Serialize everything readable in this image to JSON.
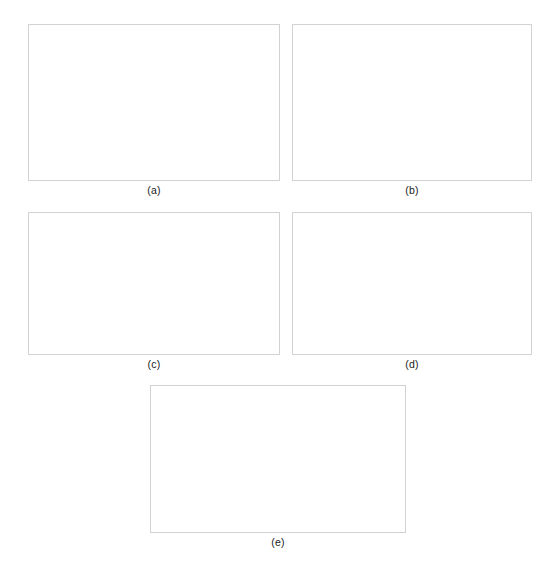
{
  "figure": {
    "background": "#ffffff",
    "panel_border_color": "#d2d2d2",
    "line_color": "#111111",
    "grid_color": "#d9d9d9",
    "captions": {
      "a": "(a)",
      "b": "(b)",
      "c": "(c)",
      "d": "(d)",
      "e": "(e)"
    }
  },
  "chart_data": [
    {
      "id": "a",
      "type": "line",
      "title": "",
      "xlabel": "Arc length, μm",
      "ylabel": "σhyd, MPa",
      "ylabel_main": "σ",
      "ylabel_sub": "hyd",
      "ylabel_tail": ", MPa",
      "xlim": [
        0,
        8
      ],
      "ylim": [
        0,
        1400
      ],
      "xticks": [
        0,
        2,
        4,
        6,
        8
      ],
      "yticks": [
        0,
        200,
        400,
        600,
        800,
        1000,
        1200,
        1400
      ],
      "ytick_labels": [
        "0",
        "200",
        "400",
        "600",
        "800",
        "1,000",
        "1,200",
        "1,400"
      ],
      "xtick_labels": [
        "0",
        "2",
        "4",
        "6",
        "8"
      ],
      "grid": true,
      "legend_position": "right",
      "series": [
        {
          "name": "1E+04",
          "style": "dotted",
          "x": [
            0,
            0.5,
            1,
            2,
            3,
            4,
            5,
            6,
            7,
            8
          ],
          "values": [
            772,
            773,
            774,
            775,
            775,
            775,
            775,
            775,
            775,
            775
          ]
        },
        {
          "name": "1E+08",
          "style": "dashed",
          "x": [
            0,
            0.5,
            1,
            2,
            3,
            4,
            5,
            6,
            7,
            8
          ],
          "values": [
            452,
            480,
            512,
            578,
            645,
            712,
            790,
            880,
            1010,
            1140
          ]
        },
        {
          "name": "1E+10",
          "style": "solid",
          "x": [
            0,
            1,
            2,
            3,
            4,
            5,
            6,
            7,
            8
          ],
          "values": [
            232,
            365,
            498,
            632,
            765,
            898,
            1032,
            1165,
            1298
          ]
        }
      ]
    },
    {
      "id": "b",
      "type": "line",
      "title": "",
      "xlabel": "Arc length, μm",
      "ylabel": "σhyd, MPa",
      "ylabel_main": "σ",
      "ylabel_sub": "hyd",
      "ylabel_tail": ", MPa",
      "xlim": [
        0,
        8
      ],
      "ylim": [
        760,
        790
      ],
      "xticks": [
        0,
        2,
        4,
        6,
        8
      ],
      "yticks": [
        760,
        765,
        770,
        775,
        780,
        785,
        790
      ],
      "ytick_labels": [
        "760",
        "765",
        "770",
        "775",
        "780",
        "785",
        "790"
      ],
      "xtick_labels": [
        "0",
        "2",
        "4",
        "6",
        "8"
      ],
      "grid": true,
      "legend_position": "right",
      "series": [
        {
          "name": "1E4",
          "style": "dotted",
          "x": [
            0,
            1,
            2,
            3,
            4,
            5,
            6,
            7,
            8
          ],
          "values": [
            775,
            775,
            775,
            775,
            775,
            775,
            775,
            775,
            775
          ]
        },
        {
          "name": "1E8",
          "style": "dashed",
          "x": [
            0,
            0.4,
            1,
            2,
            3,
            4,
            5,
            6,
            7,
            7.7,
            8
          ],
          "values": [
            770,
            769.8,
            770.6,
            771.9,
            773.2,
            774.6,
            776.2,
            778.0,
            780.1,
            781.8,
            781.4
          ]
        },
        {
          "name": "1E10",
          "style": "solid",
          "x": [
            0,
            0.15,
            0.3,
            0.6,
            1,
            2,
            3,
            4,
            5,
            6,
            7,
            7.6,
            7.85,
            8
          ],
          "values": [
            766.2,
            765.0,
            764.6,
            765.6,
            767.2,
            770.3,
            772.7,
            774.9,
            777.2,
            779.6,
            782.4,
            784.7,
            785.4,
            783.1
          ]
        }
      ]
    },
    {
      "id": "c",
      "type": "line",
      "title": "",
      "xlabel": "Arc length, μm",
      "ylabel": "N",
      "ylabel_main": "N",
      "ylabel_sub": "",
      "ylabel_tail": "",
      "xlim": [
        0,
        8
      ],
      "ylim": [
        0,
        4.5e-09
      ],
      "xticks": [
        0,
        2,
        4,
        6,
        8
      ],
      "yticks": [
        0,
        1e-09,
        2e-09,
        3e-09,
        4e-09
      ],
      "ytick_labels": [
        "0.0E+9",
        "1.0E-9",
        "2.0E-9",
        "3.0E-9",
        "4.0E-9"
      ],
      "xtick_labels": [
        "0",
        "2",
        "4",
        "6",
        "8"
      ],
      "grid": true,
      "legend_position": "right",
      "series": [
        {
          "name": "1E4",
          "style": "dotted",
          "x": [
            0,
            1,
            2,
            3,
            4,
            5,
            6,
            7,
            8
          ],
          "values": [
            1.22e-09,
            1.35e-09,
            1.5e-09,
            1.66e-09,
            1.84e-09,
            2.02e-09,
            2.22e-09,
            2.48e-09,
            2.8e-09
          ]
        },
        {
          "name": "1E8",
          "style": "dashed",
          "x": [
            0,
            1,
            2,
            3,
            4,
            5,
            6,
            7,
            8
          ],
          "values": [
            1.02e-09,
            1.2e-09,
            1.4e-09,
            1.62e-09,
            1.86e-09,
            2.18e-09,
            2.58e-09,
            3e-09,
            3.45e-09
          ]
        },
        {
          "name": "1E10",
          "style": "solid",
          "x": [
            0,
            1,
            2,
            3,
            4,
            5,
            6,
            7,
            8
          ],
          "values": [
            8.2e-10,
            1e-09,
            1.22e-09,
            1.5e-09,
            1.85e-09,
            2.3e-09,
            2.85e-09,
            3.4e-09,
            4.02e-09
          ]
        }
      ]
    },
    {
      "id": "d",
      "type": "line",
      "title": "",
      "xlabel": "Arc length, μm",
      "ylabel": "N",
      "ylabel_main": "N",
      "ylabel_sub": "",
      "ylabel_tail": "",
      "xlim": [
        0,
        8
      ],
      "ylim": [
        0,
        4.5e-09
      ],
      "xticks": [
        0,
        2,
        4,
        6,
        8
      ],
      "yticks": [
        0,
        1e-09,
        2e-09,
        3e-09,
        4e-09
      ],
      "ytick_labels": [
        "0.0E+9",
        "1.0E-9",
        "2.0E-9",
        "3.0E-9",
        "4.0E-9"
      ],
      "xtick_labels": [
        "0",
        "2",
        "4",
        "6",
        "8"
      ],
      "grid": true,
      "legend_position": "right",
      "series": [
        {
          "name": "1E4",
          "style": "dotted",
          "x": [
            0,
            1,
            2,
            3,
            4,
            5,
            6,
            7,
            8
          ],
          "values": [
            1.22e-09,
            1.35e-09,
            1.5e-09,
            1.66e-09,
            1.84e-09,
            2.02e-09,
            2.22e-09,
            2.48e-09,
            2.78e-09
          ]
        },
        {
          "name": "1E8",
          "style": "dashed",
          "x": [
            0,
            1,
            2,
            3,
            4,
            5,
            6,
            7,
            8
          ],
          "values": [
            1e-09,
            1.18e-09,
            1.38e-09,
            1.6e-09,
            1.85e-09,
            2.18e-09,
            2.58e-09,
            3e-09,
            3.45e-09
          ]
        },
        {
          "name": "1E10",
          "style": "solid",
          "x": [
            0,
            1,
            2,
            3,
            4,
            5,
            6,
            7,
            8
          ],
          "values": [
            8.2e-10,
            1e-09,
            1.22e-09,
            1.5e-09,
            1.85e-09,
            2.32e-09,
            2.88e-09,
            3.42e-09,
            4.05e-09
          ]
        }
      ]
    },
    {
      "id": "e",
      "type": "line",
      "title": "",
      "xlabel": "Arc length, μm",
      "ylabel": "M",
      "ylabel_main": "M",
      "ylabel_sub": "",
      "ylabel_tail": "",
      "xlim": [
        0,
        8
      ],
      "ylim": [
        -0.015,
        0.015
      ],
      "xticks": [
        0,
        2,
        4,
        6,
        8
      ],
      "yticks": [
        -0.015,
        -0.01,
        -0.005,
        0,
        0.005,
        0.01,
        0.015
      ],
      "ytick_labels": [
        "-1.5E-2",
        "-1.0E-2",
        "-5.0E-3",
        "0.0E+0",
        "5.0E-3",
        "1.0E-2",
        "1.5E-2"
      ],
      "xtick_labels": [
        "0",
        "2",
        "4",
        "6",
        "8"
      ],
      "grid": true,
      "legend_position": "right",
      "series": [
        {
          "name": "1E4",
          "style": "dotted",
          "x": [
            0,
            1,
            2,
            3,
            4,
            5,
            6,
            7,
            8
          ],
          "values": [
            0.0002,
            0.00015,
            0.0001,
            5e-05,
            0.0,
            -5e-05,
            -0.0001,
            -0.00015,
            -0.0002
          ]
        },
        {
          "name": "1E8",
          "style": "dashed",
          "x": [
            0,
            0.1,
            0.35,
            1,
            2,
            3,
            4,
            5,
            6,
            7,
            7.9,
            8
          ],
          "values": [
            0.0,
            0.0048,
            0.0057,
            0.0048,
            0.0035,
            0.0021,
            0.0007,
            -0.0011,
            -0.0029,
            -0.0048,
            -0.0066,
            0.0
          ]
        },
        {
          "name": "1E10",
          "style": "solid",
          "x": [
            0,
            0.1,
            0.3,
            1,
            2,
            3,
            4,
            5,
            6,
            7,
            7.9,
            8
          ],
          "values": [
            0.0,
            0.0098,
            0.0108,
            0.0092,
            0.0066,
            0.0039,
            0.0008,
            -0.0022,
            -0.0052,
            -0.0082,
            -0.0113,
            0.0
          ]
        }
      ]
    }
  ]
}
